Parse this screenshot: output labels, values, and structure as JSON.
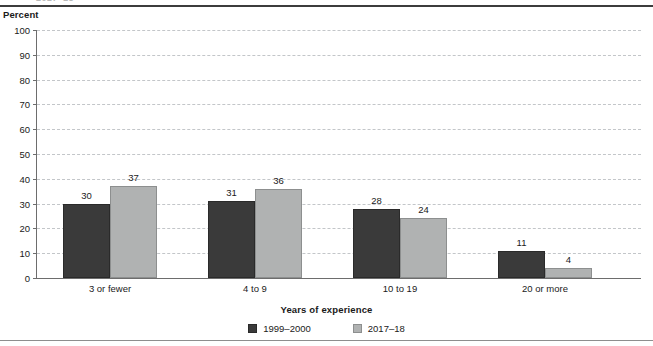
{
  "clipped_heading": "2017–18",
  "y_axis_title": "Percent",
  "chart_data": {
    "type": "bar",
    "title": "",
    "subtitle": "",
    "xlabel": "Years of experience",
    "ylabel": "Percent",
    "ylim": [
      0,
      100
    ],
    "yticks": [
      0,
      10,
      20,
      30,
      40,
      50,
      60,
      70,
      80,
      90,
      100
    ],
    "ytick_labels": [
      "0",
      "10",
      "20",
      "30",
      "40",
      "50",
      "60",
      "70",
      "80",
      "90",
      "100"
    ],
    "grid": "horizontal-dashed",
    "legend_position": "bottom-center",
    "categories": [
      "3 or fewer",
      "4 to 9",
      "10 to 19",
      "20 or more"
    ],
    "series": [
      {
        "name": "1999–2000",
        "color": "#3a3a3a",
        "values": [
          30,
          31,
          28,
          11
        ],
        "value_labels": [
          "30",
          "31",
          "28",
          "11"
        ]
      },
      {
        "name": "2017–18",
        "color": "#b0b2b2",
        "values": [
          37,
          36,
          24,
          4
        ],
        "value_labels": [
          "37",
          "36",
          "24",
          "4"
        ]
      }
    ]
  }
}
